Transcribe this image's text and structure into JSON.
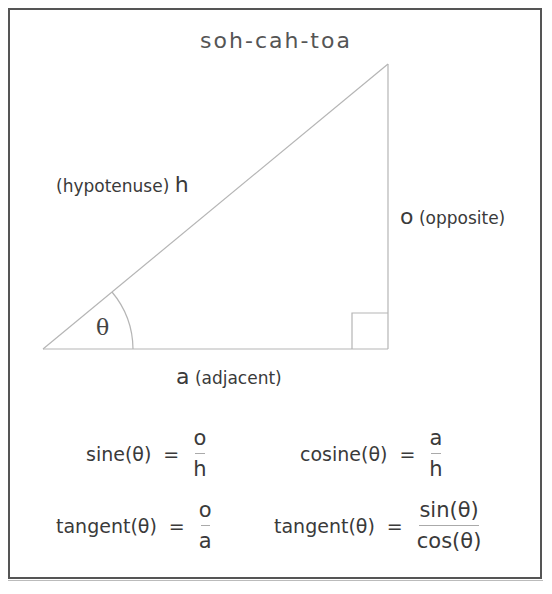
{
  "title": "soh-cah-toa",
  "triangle": {
    "hypotenuse_label": "(hypotenuse)",
    "hypotenuse_symbol": "h",
    "opposite_symbol": "o",
    "opposite_label": "(opposite)",
    "adjacent_symbol": "a",
    "adjacent_label": "(adjacent)",
    "angle_symbol": "θ"
  },
  "formulas": [
    {
      "lhs": "sine(θ)",
      "eq": "=",
      "num": "o",
      "den": "h"
    },
    {
      "lhs": "cosine(θ)",
      "eq": "=",
      "num": "a",
      "den": "h"
    },
    {
      "lhs": "tangent(θ)",
      "eq": "=",
      "num": "o",
      "den": "a"
    },
    {
      "lhs": "tangent(θ)",
      "eq": "=",
      "num": "sin(θ)",
      "den": "cos(θ)"
    }
  ],
  "colors": {
    "frame": "#555555",
    "lines": "#b5b5b5",
    "text": "#3a3a3a"
  }
}
